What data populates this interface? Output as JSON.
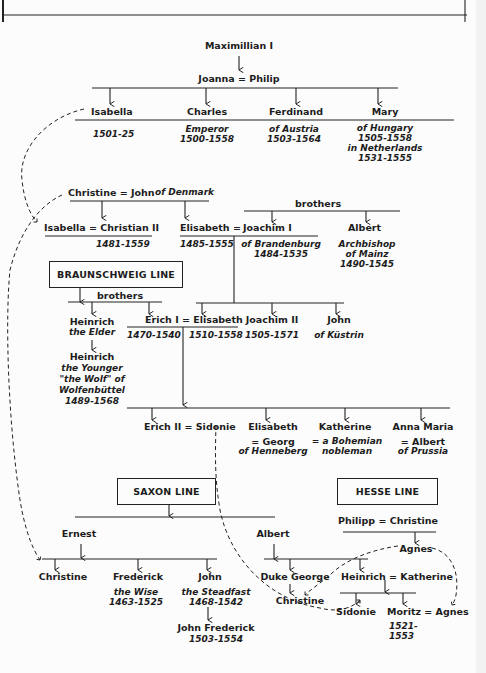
{
  "diagram": {
    "type": "genealogy",
    "generation1": {
      "name": "Maximillian I"
    },
    "generation2": {
      "couple": [
        "Joanna",
        "Philip"
      ],
      "symbol": "="
    },
    "generation3": [
      {
        "name": "Isabella",
        "lines": [
          "1501-25"
        ]
      },
      {
        "name": "Charles",
        "lines": [
          "Emperor",
          "1500-1558"
        ]
      },
      {
        "name": "Ferdinand",
        "lines": [
          "of Austria",
          "1503-1564"
        ]
      },
      {
        "name": "Mary",
        "lines": [
          "of Hungary",
          "1505-1558",
          "in Netherlands",
          "1531-1555"
        ]
      }
    ],
    "denmark": {
      "couple": "Christine = John",
      "suffix": "of Denmark",
      "children": [
        {
          "name": "Isabella = Christian II",
          "lines": [
            "1481-1559"
          ]
        },
        {
          "name": "Elisabeth =",
          "lines": [
            "1485-1555"
          ]
        }
      ]
    },
    "brandenburg": {
      "brothers_label": "brothers",
      "joachim": {
        "name": "Joachim I",
        "lines": [
          "of Brandenburg",
          "1484-1535"
        ]
      },
      "albert": {
        "name": "Albert",
        "lines": [
          "Archbishop",
          "of Mainz",
          "1490-1545"
        ]
      },
      "children": [
        {
          "name": "Erich I = Elisabeth",
          "lines": [
            "1470-1540",
            "1510-1558"
          ]
        },
        {
          "name": "Joachim II",
          "lines": [
            "1505-1571"
          ]
        },
        {
          "name": "John",
          "lines": [
            "of Küstrin"
          ]
        }
      ]
    },
    "braunschweig": {
      "title": "BRAUNSCHWEIG LINE",
      "brothers_label": "brothers",
      "heinrich_elder": {
        "name": "Heinrich",
        "lines": [
          "the Elder"
        ]
      },
      "heinrich_younger": {
        "name": "Heinrich",
        "lines": [
          "the Younger",
          "\"the Wolf\" of",
          "Wolfenbüttel",
          "1489-1568"
        ]
      }
    },
    "erich_children": [
      {
        "name": "Erich II = Sidonie"
      },
      {
        "name": "Elisabeth",
        "lines": [
          "= Georg",
          "of Henneberg"
        ]
      },
      {
        "name": "Katherine",
        "lines": [
          "= a Bohemian",
          "nobleman"
        ]
      },
      {
        "name": "Anna Maria",
        "lines": [
          "= Albert",
          "of Prussia"
        ]
      }
    ],
    "saxon": {
      "title": "SAXON LINE",
      "ernest": "Ernest",
      "albert": "Albert",
      "ernest_children": [
        {
          "name": "Christine",
          "lines": []
        },
        {
          "name": "Frederick",
          "lines": [
            "the Wise",
            "1463-1525"
          ]
        },
        {
          "name": "John",
          "lines": [
            "the Steadfast",
            "1468-1542"
          ]
        }
      ],
      "john_child": {
        "name": "John Frederick",
        "lines": [
          "1503-1554"
        ]
      },
      "albert_children": [
        {
          "name": "Duke George",
          "child": "Christine"
        },
        {
          "name": "Heinrich = Katherine"
        }
      ],
      "heinrich_children": [
        {
          "name": "Sidonie"
        },
        {
          "name": "Moritz = Agnes",
          "lines": [
            "1521-",
            "1553"
          ]
        }
      ]
    },
    "hesse": {
      "title": "HESSE LINE",
      "couple": "Philipp = Christine",
      "child": "Agnes"
    }
  }
}
